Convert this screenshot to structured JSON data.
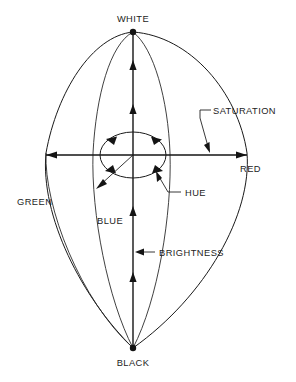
{
  "figure": {
    "type": "diagram",
    "background_color": "#ffffff",
    "line_color": "#1a1a1a"
  },
  "labels": {
    "white": "WHITE",
    "black": "BLACK",
    "red": "RED",
    "green": "GREEN",
    "blue": "BLUE",
    "hue": "HUE",
    "saturation": "SATURATION",
    "brightness": "BRIGHTNESS"
  },
  "geometry": {
    "apex_white": [
      133,
      32
    ],
    "apex_black": [
      133,
      348
    ],
    "center": [
      133,
      155
    ],
    "horizontal_axis": [
      45,
      155,
      248,
      155
    ],
    "hue_ellipse_rx": 33,
    "hue_ellipse_ry": 23
  },
  "icons": {
    "arrowhead": "arrow-head",
    "vertex_dot": "vertex-dot"
  }
}
